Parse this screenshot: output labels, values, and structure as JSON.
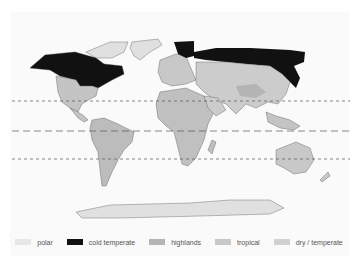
{
  "map": {
    "title": "World climate zones",
    "reference_lines": [
      {
        "name": "tropic-of-cancer",
        "y": 101,
        "style": "dashed"
      },
      {
        "name": "equator",
        "y": 131,
        "style": "long-dashed"
      },
      {
        "name": "tropic-of-capricorn",
        "y": 159,
        "style": "dashed"
      }
    ]
  },
  "legend": {
    "items": [
      {
        "label": "polar",
        "color": "#e6e6e6"
      },
      {
        "label": "cold temperate",
        "color": "#111111"
      },
      {
        "label": "highlands",
        "color": "#b4b4b4"
      },
      {
        "label": "tropical",
        "color": "#c8c8c8"
      },
      {
        "label": "dry / temperate",
        "color": "#d0d0d0"
      }
    ]
  }
}
